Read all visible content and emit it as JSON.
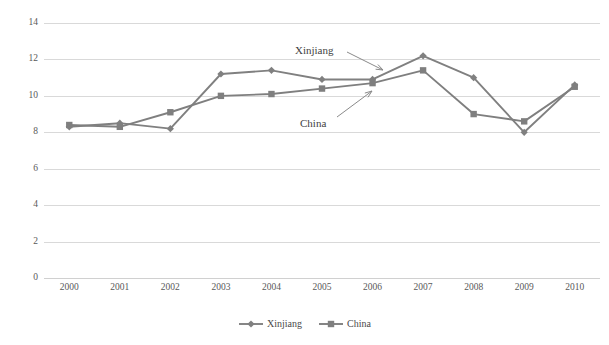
{
  "chart_data": {
    "type": "line",
    "title": "",
    "xlabel": "",
    "ylabel": "",
    "x": [
      "2000",
      "2001",
      "2002",
      "2003",
      "2004",
      "2005",
      "2006",
      "2007",
      "2008",
      "2009",
      "2010"
    ],
    "categories": [
      "2000",
      "2001",
      "2002",
      "2003",
      "2004",
      "2005",
      "2006",
      "2007",
      "2008",
      "2009",
      "2010"
    ],
    "series": [
      {
        "name": "Xinjiang",
        "marker": "diamond",
        "color": "#808080",
        "values": [
          8.3,
          8.5,
          8.2,
          11.2,
          11.4,
          10.9,
          10.9,
          12.2,
          11.0,
          8.0,
          10.6
        ]
      },
      {
        "name": "China",
        "marker": "square",
        "color": "#7f7f7f",
        "values": [
          8.4,
          8.3,
          9.1,
          10.0,
          10.1,
          10.4,
          10.7,
          11.4,
          9.0,
          8.6,
          10.5
        ]
      }
    ],
    "ylim": [
      0,
      14
    ],
    "yticks": [
      0,
      2,
      4,
      6,
      8,
      10,
      12,
      14
    ],
    "ytick_labels": [
      "0",
      "2",
      "4",
      "6",
      "8",
      "10",
      "12",
      "14"
    ],
    "grid": true,
    "legend_position": "bottom",
    "annotations": [
      {
        "text": "Xinjiang",
        "x": 295,
        "y": 45,
        "arrow_from_x": 347,
        "arrow_from_y": 52,
        "arrow_to_x": 383,
        "arrow_to_y": 70
      },
      {
        "text": "China",
        "x": 300,
        "y": 118,
        "arrow_from_x": 337,
        "arrow_from_y": 117,
        "arrow_to_x": 372,
        "arrow_to_y": 91
      }
    ]
  },
  "legend": {
    "items": [
      {
        "label": "Xinjiang",
        "marker": "diamond"
      },
      {
        "label": "China",
        "marker": "square"
      }
    ]
  }
}
